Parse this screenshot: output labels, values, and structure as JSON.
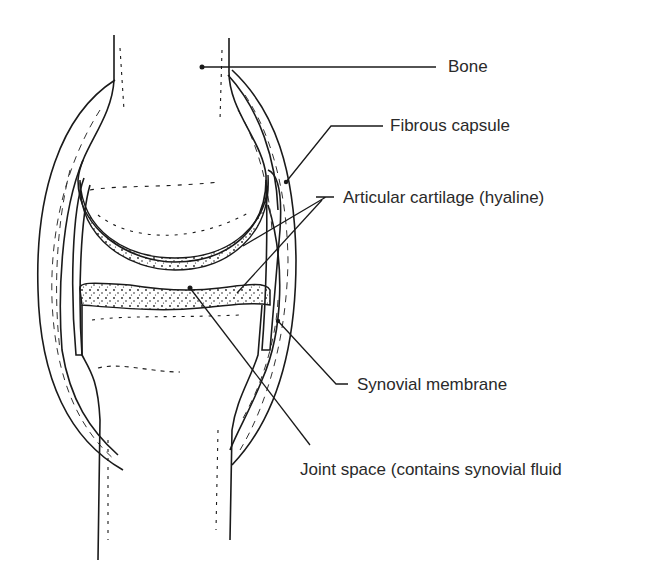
{
  "diagram": {
    "colors": {
      "ink": "#1a1a1a",
      "background": "#ffffff",
      "label": "#2a2a2a"
    },
    "labels": [
      {
        "id": "bone",
        "text": "Bone"
      },
      {
        "id": "fibrous-capsule",
        "text": "Fibrous capsule"
      },
      {
        "id": "articular-cartilage",
        "text": "Articular cartilage (hyaline)"
      },
      {
        "id": "synovial-membrane",
        "text": "Synovial membrane"
      },
      {
        "id": "joint-space",
        "text": "Joint space (contains synovial fluid"
      }
    ]
  }
}
